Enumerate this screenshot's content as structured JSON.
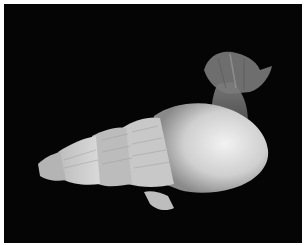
{
  "image": {
    "description": "Grayscale photograph of a spiral gastropod shell with a translucent flower-like organism emerging from its aperture, on a black background",
    "background_color": "#050505",
    "border_color": "#ffffff",
    "subjects": [
      {
        "name": "gastropod-shell",
        "tone": "#d8d8d8"
      },
      {
        "name": "translucent-creature",
        "tone": "#6a6a6a"
      }
    ]
  }
}
